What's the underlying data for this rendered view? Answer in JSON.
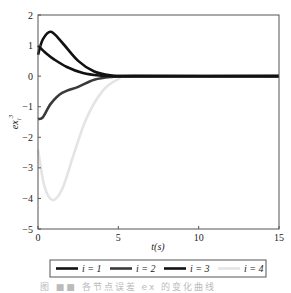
{
  "chart_data": {
    "type": "line",
    "title": "",
    "xlabel": "t(s)",
    "ylabel": "ex_i^3",
    "xlim": [
      0,
      15
    ],
    "ylim": [
      -5,
      2
    ],
    "xticks": [
      0,
      5,
      10,
      15
    ],
    "yticks": [
      2,
      1,
      0,
      -1,
      -2,
      -3,
      -4,
      -5
    ],
    "grid": false,
    "legend_position": "below",
    "series": [
      {
        "name": "i=1",
        "color": "#111111",
        "x": [
          0,
          0.3,
          0.8,
          1.5,
          2.5,
          3.5,
          4.5,
          6,
          15
        ],
        "y": [
          0.7,
          1.2,
          1.45,
          1.1,
          0.5,
          0.15,
          0.03,
          0,
          0
        ]
      },
      {
        "name": "i=2",
        "color": "#3a3a3a",
        "x": [
          0,
          0.3,
          0.8,
          1.5,
          2.5,
          3.5,
          4.5,
          6,
          15
        ],
        "y": [
          -1.4,
          -1.35,
          -0.9,
          -0.55,
          -0.35,
          -0.12,
          -0.03,
          0,
          0
        ]
      },
      {
        "name": "i=3",
        "color": "#111111",
        "x": [
          0,
          0.5,
          1.0,
          1.8,
          2.8,
          3.8,
          5,
          6,
          15
        ],
        "y": [
          1.0,
          0.75,
          0.55,
          0.3,
          0.1,
          0.02,
          0,
          0,
          0
        ]
      },
      {
        "name": "i=4",
        "color": "#e4e4e4",
        "x": [
          0,
          0.4,
          0.9,
          1.5,
          2.2,
          3.0,
          4.0,
          5.0,
          6.0,
          15
        ],
        "y": [
          -2.4,
          -3.6,
          -4.05,
          -3.7,
          -2.6,
          -1.4,
          -0.5,
          -0.1,
          0,
          0
        ]
      }
    ]
  },
  "axes": {
    "xlabel": "t(s)",
    "ylabel_base": "ex",
    "ylabel_sub": "i",
    "ylabel_sup": "3",
    "xtick_labels": [
      "0",
      "5",
      "10",
      "15"
    ],
    "ytick_labels": [
      "2",
      "1",
      "0",
      "−1",
      "−2",
      "−3",
      "−4",
      "−5"
    ]
  },
  "legend": {
    "items": [
      {
        "label": "i = 1",
        "color": "#111111"
      },
      {
        "label": "i = 2",
        "color": "#3a3a3a"
      },
      {
        "label": "i = 3",
        "color": "#111111"
      },
      {
        "label": "i = 4",
        "color": "#e4e4e4"
      }
    ]
  },
  "caption": "图 ■■ 各节点误差 ex 的变化曲线"
}
